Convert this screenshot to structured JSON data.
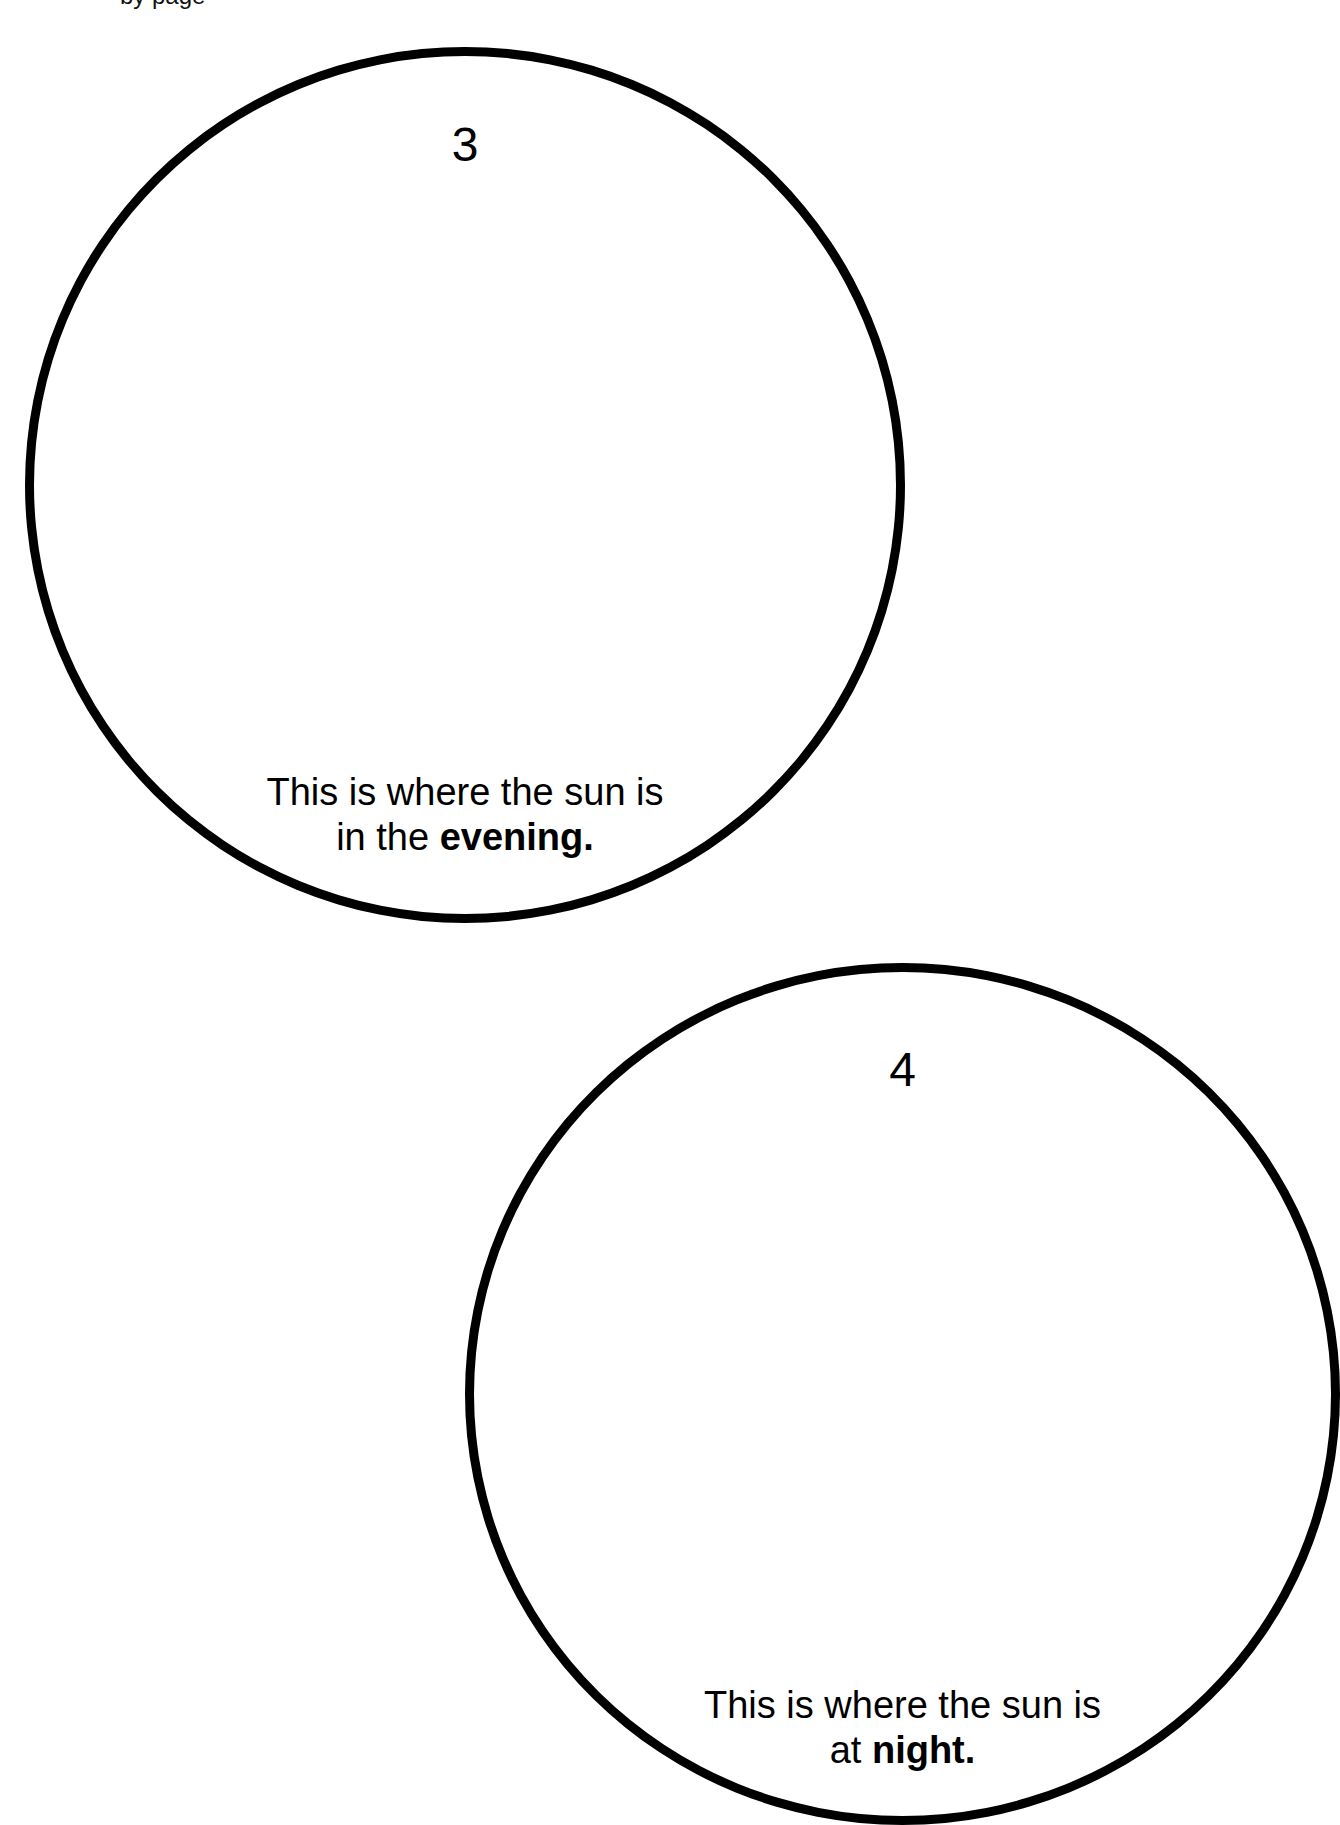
{
  "header": {
    "partial_text": "                    by        page"
  },
  "circles": [
    {
      "number": "3",
      "caption": {
        "line1": "This is where the sun is",
        "line2_prefix": "in the ",
        "line2_bold": "evening."
      }
    },
    {
      "number": "4",
      "caption": {
        "line1": "This is where the sun is",
        "line2_prefix": "at ",
        "line2_bold": "night."
      }
    }
  ],
  "colors": {
    "stroke": "#000000",
    "background": "#ffffff",
    "text": "#000000"
  }
}
